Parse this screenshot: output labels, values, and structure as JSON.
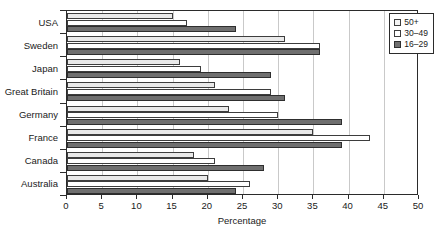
{
  "chart_data": {
    "type": "bar",
    "orientation": "horizontal",
    "title": "",
    "xlabel": "Percentage",
    "ylabel": "",
    "xlim": [
      0,
      50
    ],
    "xticks": [
      0,
      5,
      10,
      15,
      20,
      25,
      30,
      35,
      40,
      45,
      50
    ],
    "grid": true,
    "legend_position": "top-right",
    "categories": [
      "USA",
      "Sweden",
      "Japan",
      "Great Britain",
      "Germany",
      "France",
      "Canada",
      "Australia"
    ],
    "series": [
      {
        "name": "50+",
        "color": "#e9e9e9",
        "values": [
          15,
          31,
          16,
          21,
          23,
          35,
          18,
          20
        ]
      },
      {
        "name": "30–49",
        "color": "#ffffff",
        "values": [
          17,
          36,
          19,
          29,
          30,
          43,
          21,
          26
        ]
      },
      {
        "name": "16–29",
        "color": "#6f6f6f",
        "values": [
          24,
          36,
          29,
          31,
          39,
          39,
          28,
          24
        ]
      }
    ]
  },
  "axis": {
    "x_title": "Percentage",
    "x_tick_labels": [
      "0",
      "5",
      "10",
      "15",
      "20",
      "25",
      "30",
      "35",
      "40",
      "45",
      "50"
    ],
    "y_tick_labels": [
      "USA",
      "Sweden",
      "Japan",
      "Great Britain",
      "Germany",
      "France",
      "Canada",
      "Australia"
    ]
  },
  "legend": {
    "items": [
      {
        "label": "50+"
      },
      {
        "label": "30–49"
      },
      {
        "label": "16–29"
      }
    ]
  }
}
